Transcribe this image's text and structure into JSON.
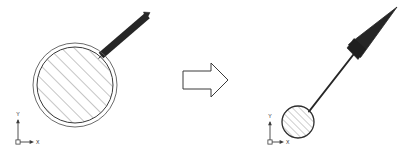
{
  "document": {
    "title": "CAD Transformation Diagram",
    "background_color": "#ffffff",
    "width": 404,
    "height": 158
  },
  "palette": {
    "outline": "#3a3a3a",
    "hatch": "#6e6e6e",
    "solid_fill": "#262626",
    "axis": "#3c3c3c",
    "text": "#2b2b2b"
  },
  "left_figure": {
    "name": "original-part",
    "circle_outer": {
      "cx": 75,
      "cy": 85,
      "r": 42
    },
    "circle_inner": {
      "cx": 75,
      "cy": 85,
      "r": 38
    },
    "hatch_angle_deg": 45,
    "hatch_spacing": 9,
    "stem": {
      "from_x": 101,
      "from_y": 55,
      "to_x": 147,
      "to_y": 15,
      "width": 7
    }
  },
  "transform_arrow": {
    "name": "transformation-arrow",
    "direction": "right",
    "x": 183,
    "y": 63,
    "width": 45,
    "height": 34,
    "filled": false
  },
  "right_figure": {
    "name": "transformed-part",
    "circle": {
      "cx": 298,
      "cy": 122,
      "r": 16
    },
    "hatch_angle_deg": 45,
    "hatch_spacing": 5,
    "stem": {
      "from_x": 309,
      "from_y": 111,
      "to_x": 357,
      "to_y": 50,
      "width": 2
    },
    "cone": {
      "base_x": 355,
      "base_y": 51,
      "tip_x": 396,
      "tip_y": 8,
      "base_width": 16
    }
  },
  "axis_indicators": [
    {
      "name": "axis-indicator-left",
      "origin_x": 18,
      "origin_y": 142,
      "arm_length": 22,
      "y_label": "Y",
      "x_label": "X",
      "origin_marker": "square"
    },
    {
      "name": "axis-indicator-right",
      "origin_x": 270,
      "origin_y": 142,
      "arm_length": 20,
      "y_label": "Y",
      "x_label": "X",
      "origin_marker": "square"
    }
  ]
}
